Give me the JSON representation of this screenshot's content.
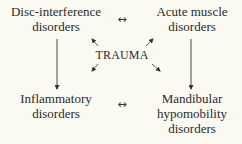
{
  "diagram": {
    "center": {
      "label": "TRAUMA"
    },
    "nodes": [
      {
        "id": "top-left",
        "lines": [
          "Disc-interference",
          "disorders"
        ]
      },
      {
        "id": "top-right",
        "lines": [
          "Acute muscle",
          "disorders"
        ]
      },
      {
        "id": "bottom-left",
        "lines": [
          "Inflammatory",
          "disorders"
        ]
      },
      {
        "id": "bottom-right",
        "lines": [
          "Mandibular",
          "hypomobility",
          "disorders"
        ]
      }
    ],
    "connectors": {
      "top_bidirectional": "↔",
      "bottom_bidirectional": "↔"
    },
    "edges": [
      {
        "from": "top-left",
        "to": "top-right",
        "type": "bidirectional"
      },
      {
        "from": "bottom-left",
        "to": "bottom-right",
        "type": "bidirectional"
      },
      {
        "from": "top-left",
        "to": "bottom-left",
        "type": "directed"
      },
      {
        "from": "top-right",
        "to": "bottom-right",
        "type": "directed"
      },
      {
        "from": "TRAUMA",
        "to": "top-left",
        "type": "directed"
      },
      {
        "from": "TRAUMA",
        "to": "top-right",
        "type": "directed"
      },
      {
        "from": "TRAUMA",
        "to": "bottom-left",
        "type": "directed"
      },
      {
        "from": "TRAUMA",
        "to": "bottom-right",
        "type": "directed"
      }
    ]
  }
}
